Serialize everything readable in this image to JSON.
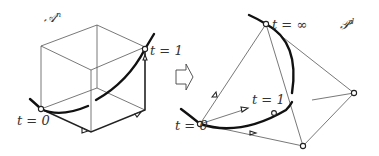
{
  "left_figure": {
    "space_label": "𝒜",
    "space_superscript": "n",
    "label_t0": "t = 0",
    "label_t1": "t = 1"
  },
  "arrow": {
    "icon": "hollow-right-arrow-icon"
  },
  "right_figure": {
    "space_label": "𝒫",
    "space_superscript": "d",
    "label_t0": "t = 0",
    "label_t1": "t = 1",
    "label_tinf": "t = ∞"
  },
  "colors": {
    "ink": "#222222",
    "background": "#ffffff"
  }
}
